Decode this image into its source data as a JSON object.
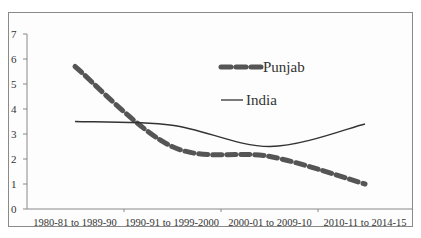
{
  "chart_data": {
    "type": "line",
    "title": "",
    "xlabel": "",
    "ylabel": "",
    "ylim": [
      0,
      7
    ],
    "yticks": [
      0,
      1,
      2,
      3,
      4,
      5,
      6,
      7
    ],
    "grid": false,
    "legend_position": "upper-right-inside",
    "categories": [
      "1980-81 to 1989-90",
      "1990-91 to 1999-2000",
      "2000-01 to 2009-10",
      "2010-11 to 2014-15"
    ],
    "series": [
      {
        "name": "Punjab",
        "style": "dashed-thick",
        "color": "#555555",
        "values": [
          5.7,
          2.5,
          2.1,
          1.0
        ]
      },
      {
        "name": "India",
        "style": "solid-thin",
        "color": "#333333",
        "values": [
          3.5,
          3.35,
          2.5,
          3.4
        ]
      }
    ]
  },
  "legend": {
    "items": [
      {
        "label": "Punjab"
      },
      {
        "label": "India"
      }
    ]
  }
}
